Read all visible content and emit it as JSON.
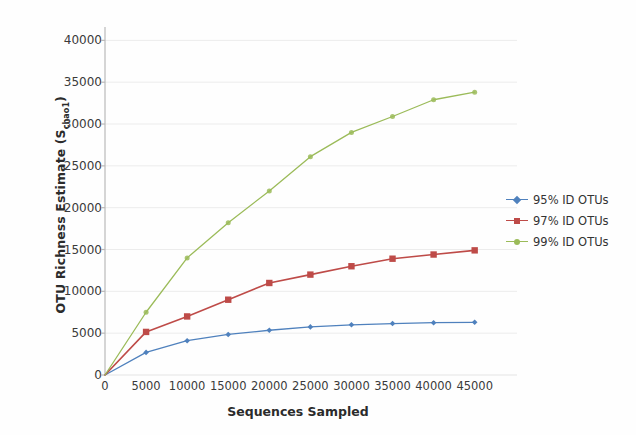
{
  "chart_data": {
    "type": "line",
    "title": "",
    "xlabel": "Sequences Sampled",
    "ylabel": "OTU Richness Estimate (S",
    "ylabel_sub": "chao1",
    "ylabel_tail": ")",
    "x": [
      0,
      1000,
      2500,
      5000,
      7500,
      10000,
      12500,
      15000,
      17500,
      20000,
      22500,
      25000,
      27500,
      30000,
      32500,
      35000,
      37500,
      40000,
      42500,
      45000
    ],
    "xlim": [
      0,
      46500
    ],
    "ylim": [
      0,
      41000
    ],
    "xticks": [
      "0",
      "5000",
      "10000",
      "15000",
      "20000",
      "25000",
      "30000",
      "35000",
      "40000",
      "45000"
    ],
    "xtick_values": [
      0,
      5000,
      10000,
      15000,
      20000,
      25000,
      30000,
      35000,
      40000,
      45000
    ],
    "yticks": [
      "0",
      "5000",
      "10000",
      "15000",
      "20000",
      "25000",
      "30000",
      "35000",
      "40000"
    ],
    "ytick_values": [
      0,
      5000,
      10000,
      15000,
      20000,
      25000,
      30000,
      35000,
      40000
    ],
    "grid": "horizontal",
    "legend_position": "right",
    "series": [
      {
        "name": "95% ID OTUs",
        "color": "#4f81bd",
        "marker": "diamond",
        "x": [
          0,
          5000,
          10000,
          15000,
          20000,
          25000,
          30000,
          35000,
          40000,
          45000
        ],
        "values": [
          0,
          2700,
          4100,
          4850,
          5350,
          5750,
          6000,
          6150,
          6250,
          6300
        ]
      },
      {
        "name": "97% ID OTUs",
        "color": "#be4b48",
        "marker": "square",
        "x": [
          0,
          5000,
          10000,
          15000,
          20000,
          25000,
          30000,
          35000,
          40000,
          45000
        ],
        "values": [
          0,
          5150,
          7000,
          9000,
          11000,
          12000,
          13000,
          13900,
          14400,
          14900
        ]
      },
      {
        "name": "99% ID OTUs",
        "color": "#9bbb59",
        "marker": "circle",
        "x": [
          0,
          5000,
          10000,
          15000,
          20000,
          25000,
          30000,
          35000,
          40000,
          45000
        ],
        "values": [
          0,
          7500,
          14000,
          18200,
          22000,
          26100,
          29000,
          30900,
          32900,
          33800
        ]
      }
    ]
  },
  "legend": {
    "items": [
      {
        "label": "95% ID OTUs",
        "color": "#4f81bd"
      },
      {
        "label": "97% ID OTUs",
        "color": "#be4b48"
      },
      {
        "label": "99% ID OTUs",
        "color": "#9bbb59"
      }
    ]
  },
  "axes": {
    "axis_color": "#b9b9b9",
    "grid_color": "#ececec",
    "text_color": "#3a3a3a"
  }
}
